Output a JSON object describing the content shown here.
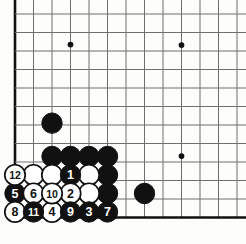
{
  "diagram": {
    "type": "go-board-problem-diagram",
    "board_size": 19,
    "visible_region": "bottom-left corner",
    "background_color": "#fdfdfb",
    "line_color": "#6f6f6f",
    "edge_color": "#111111",
    "black_color": "#111111",
    "white_color": "#ffffff",
    "geometry": {
      "origin_x": 15,
      "origin_y": 14,
      "spacing": 18.5,
      "cols": 13,
      "rows": 12,
      "stone_radius": 10.2,
      "left_edge_col": 0,
      "bottom_edge_row": 11
    },
    "star_points": [
      {
        "col": 3,
        "row": 1.65
      },
      {
        "col": 9,
        "row": 1.68
      },
      {
        "col": 9,
        "row": 7.68
      }
    ],
    "plain_stones": [
      {
        "col": 2,
        "row": 5.9,
        "color": "black",
        "name": "black-stone-outpost"
      },
      {
        "col": 2,
        "row": 7.7,
        "color": "black",
        "name": "black-wall-stone"
      },
      {
        "col": 3,
        "row": 7.7,
        "color": "black",
        "name": "black-wall-stone"
      },
      {
        "col": 4,
        "row": 7.7,
        "color": "black",
        "name": "black-wall-stone"
      },
      {
        "col": 5,
        "row": 7.7,
        "color": "black",
        "name": "black-wall-stone"
      },
      {
        "col": 5,
        "row": 8.7,
        "color": "black",
        "name": "black-wall-stone"
      },
      {
        "col": 5,
        "row": 9.7,
        "color": "black",
        "name": "black-wall-stone"
      },
      {
        "col": 1,
        "row": 8.7,
        "color": "white",
        "name": "white-group-stone"
      },
      {
        "col": 2,
        "row": 8.7,
        "color": "white",
        "name": "white-group-stone"
      },
      {
        "col": 4,
        "row": 8.7,
        "color": "white",
        "name": "white-group-stone"
      },
      {
        "col": 4,
        "row": 9.7,
        "color": "white",
        "name": "white-group-stone"
      },
      {
        "col": 7,
        "row": 9.7,
        "color": "black",
        "name": "black-stone-right"
      }
    ],
    "numbered_stones": [
      {
        "label": "1",
        "col": 3,
        "row": 8.7,
        "color": "black"
      },
      {
        "label": "2",
        "col": 3,
        "row": 9.7,
        "color": "white"
      },
      {
        "label": "3",
        "col": 4,
        "row": 10.7,
        "color": "black"
      },
      {
        "label": "4",
        "col": 2,
        "row": 10.7,
        "color": "white"
      },
      {
        "label": "5",
        "col": 0,
        "row": 9.7,
        "color": "black"
      },
      {
        "label": "6",
        "col": 1,
        "row": 9.7,
        "color": "white"
      },
      {
        "label": "7",
        "col": 5,
        "row": 10.7,
        "color": "black"
      },
      {
        "label": "8",
        "col": 0,
        "row": 10.7,
        "color": "white"
      },
      {
        "label": "9",
        "col": 3,
        "row": 10.7,
        "color": "black"
      },
      {
        "label": "10",
        "col": 2,
        "row": 9.7,
        "color": "white"
      },
      {
        "label": "11",
        "col": 1,
        "row": 10.7,
        "color": "black"
      },
      {
        "label": "12",
        "col": 0,
        "row": 8.7,
        "color": "white"
      }
    ]
  }
}
